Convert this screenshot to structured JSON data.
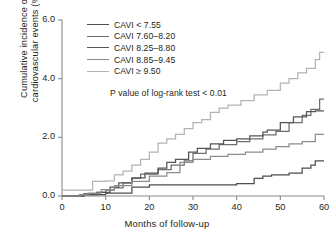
{
  "chart_data": {
    "type": "line",
    "title": "",
    "xlabel": "Months of follow-up",
    "ylabel": "Cumulative incidence of\ncardiovascular events (%)",
    "xlim": [
      0,
      60
    ],
    "ylim": [
      0,
      6.0
    ],
    "xticks": [
      0,
      10,
      20,
      30,
      40,
      50,
      60
    ],
    "xtick_labels": [
      "0",
      "10",
      "20",
      "30",
      "40",
      "50",
      "60"
    ],
    "yticks": [
      0.0,
      2.0,
      4.0,
      6.0
    ],
    "ytick_labels": [
      "0.0",
      "2.0",
      "4.0",
      "6.0"
    ],
    "grid": false,
    "legend_position": "upper-left-inside",
    "annotations": [
      {
        "name": "log-rank-pvalue",
        "text": "P value of log-rank test < 0.01"
      }
    ],
    "series": [
      {
        "name": "CAVI < 7.55",
        "label": "CAVI < 7.55",
        "color": "#4d4d4d",
        "step": "post",
        "x": [
          0,
          4,
          5,
          7,
          10,
          11,
          16,
          20,
          40,
          44,
          46,
          48,
          52,
          55,
          57,
          58,
          60
        ],
        "y": [
          0.0,
          0.0,
          0.05,
          0.05,
          0.1,
          0.1,
          0.3,
          0.38,
          0.42,
          0.6,
          0.68,
          0.72,
          0.78,
          0.95,
          1.05,
          1.2,
          1.2
        ]
      },
      {
        "name": "CAVI 7.60-8.20",
        "label": "CAVI 7.60–8.20",
        "color": "#6e6e6e",
        "step": "post",
        "x": [
          0,
          3,
          5,
          8,
          10,
          12,
          14,
          16,
          18,
          22,
          25,
          28,
          30,
          33,
          36,
          40,
          43,
          46,
          49,
          52,
          55,
          57,
          59,
          60
        ],
        "y": [
          0.0,
          0.0,
          0.08,
          0.12,
          0.2,
          0.28,
          0.45,
          0.6,
          0.75,
          0.9,
          1.05,
          1.2,
          1.45,
          1.6,
          1.75,
          1.85,
          1.95,
          2.08,
          2.2,
          2.5,
          2.75,
          2.95,
          3.3,
          3.3
        ]
      },
      {
        "name": "CAVI 8.25-8.80",
        "label": "CAVI 8.25–8.80",
        "color": "#555555",
        "step": "post",
        "x": [
          0,
          4,
          8,
          11,
          13,
          16,
          19,
          22,
          24,
          26,
          29,
          31,
          34,
          37,
          40,
          43,
          46,
          47,
          50,
          53,
          56,
          58,
          60
        ],
        "y": [
          0.0,
          0.05,
          0.12,
          0.3,
          0.45,
          0.62,
          0.78,
          0.95,
          1.15,
          1.25,
          1.5,
          1.62,
          1.78,
          1.9,
          1.95,
          2.05,
          2.18,
          2.25,
          2.5,
          2.7,
          2.88,
          2.9,
          2.9
        ]
      },
      {
        "name": "CAVI 8.85-9.45",
        "label": "CAVI 8.85–9.45",
        "color": "#8c8c8c",
        "step": "post",
        "x": [
          0,
          4,
          6,
          9,
          12,
          16,
          20,
          24,
          27,
          30,
          34,
          38,
          42,
          46,
          49,
          52,
          55,
          58,
          60
        ],
        "y": [
          0.0,
          0.05,
          0.1,
          0.22,
          0.35,
          0.5,
          0.68,
          0.8,
          1.15,
          1.25,
          1.35,
          1.42,
          1.5,
          1.6,
          1.68,
          1.78,
          1.85,
          2.1,
          2.1
        ]
      },
      {
        "name": "CAVI >= 9.50",
        "label": "CAVI ≥ 9.50",
        "color": "#b3b3b3",
        "step": "post",
        "x": [
          0,
          3,
          7,
          10,
          12,
          14,
          16,
          18,
          20,
          22,
          24,
          26,
          28,
          30,
          32,
          34,
          36,
          38,
          41,
          44,
          47,
          50,
          52,
          54,
          56,
          58,
          59,
          60
        ],
        "y": [
          0.2,
          0.2,
          0.5,
          0.52,
          0.72,
          0.85,
          1.05,
          1.25,
          1.5,
          1.8,
          1.95,
          2.1,
          2.3,
          2.5,
          2.6,
          2.85,
          3.0,
          3.1,
          3.25,
          3.45,
          3.6,
          3.85,
          4.0,
          4.2,
          4.35,
          4.65,
          4.9,
          4.9
        ]
      }
    ]
  },
  "axes": {
    "axis_color": "#8a8a8a",
    "text_color": "#231f20"
  }
}
